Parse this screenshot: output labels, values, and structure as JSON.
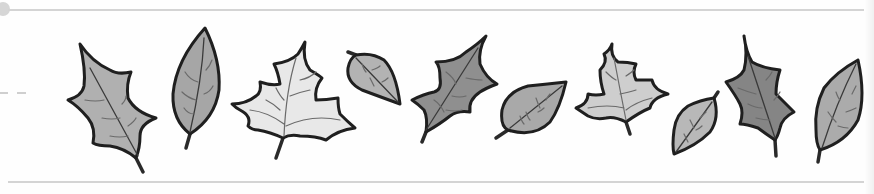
{
  "illustration": {
    "title": "Autumn leaves border",
    "background": "#ffffff",
    "border_color": "#d4d4d4",
    "leaves": [
      {
        "kind": "holly",
        "fill": "#b0b0b0"
      },
      {
        "kind": "ovate",
        "fill": "#a6a6a6"
      },
      {
        "kind": "maple",
        "fill": "#e8e8e8"
      },
      {
        "kind": "round-small",
        "fill": "#b3b3b3"
      },
      {
        "kind": "holly",
        "fill": "#8f8f8f"
      },
      {
        "kind": "round",
        "fill": "#a9a9a9"
      },
      {
        "kind": "maple",
        "fill": "#cecece"
      },
      {
        "kind": "round-small",
        "fill": "#b8b8b8"
      },
      {
        "kind": "holly",
        "fill": "#858585"
      },
      {
        "kind": "ovate",
        "fill": "#ababab"
      }
    ]
  }
}
